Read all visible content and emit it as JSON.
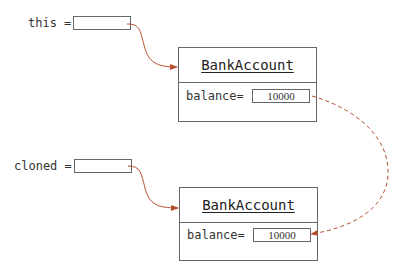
{
  "variables": [
    {
      "name": "this",
      "label": "this ="
    },
    {
      "name": "cloned",
      "label": "cloned ="
    }
  ],
  "objects": [
    {
      "class_name": "BankAccount",
      "field_label": "balance=",
      "field_value": "10000"
    },
    {
      "class_name": "BankAccount",
      "field_label": "balance=",
      "field_value": "10000"
    }
  ],
  "colors": {
    "arrow": "#b5502f",
    "dashed_arrow": "#b5502f",
    "border": "#666666"
  }
}
